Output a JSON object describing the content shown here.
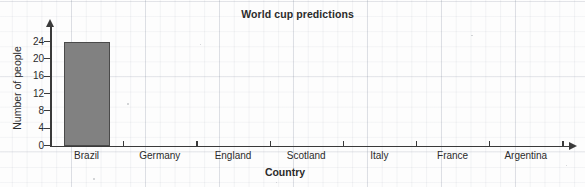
{
  "chart_data": {
    "type": "bar",
    "title": "World cup predictions",
    "xlabel": "Country",
    "ylabel": "Number of people",
    "categories": [
      "Brazil",
      "Germany",
      "England",
      "Scotland",
      "Italy",
      "France",
      "Argentina"
    ],
    "values": [
      24,
      0,
      0,
      0,
      0,
      0,
      0
    ],
    "ylim": [
      0,
      26
    ],
    "yticks": [
      0,
      4,
      8,
      12,
      16,
      20,
      24
    ],
    "ytick_labels": [
      "0",
      "4",
      "8",
      "12",
      "16",
      "20",
      "24"
    ],
    "grid": "faint-graph-paper",
    "legend": "none",
    "bar_color": "#818181",
    "bar_border_color": "#4a4a4a",
    "axis_color": "#3a3a3a",
    "background_color": "#fdfdfd"
  }
}
